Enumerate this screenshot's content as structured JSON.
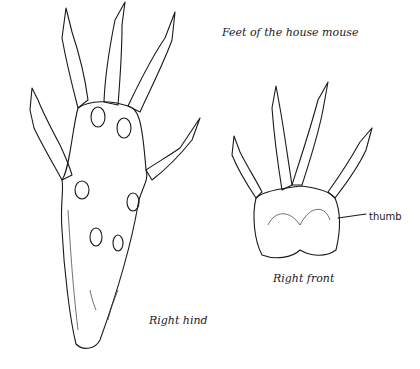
{
  "figure": {
    "title": "Feet of the house mouse",
    "labels": {
      "right_hind": "Right hind",
      "right_front": "Right front",
      "thumb": "thumb"
    }
  }
}
